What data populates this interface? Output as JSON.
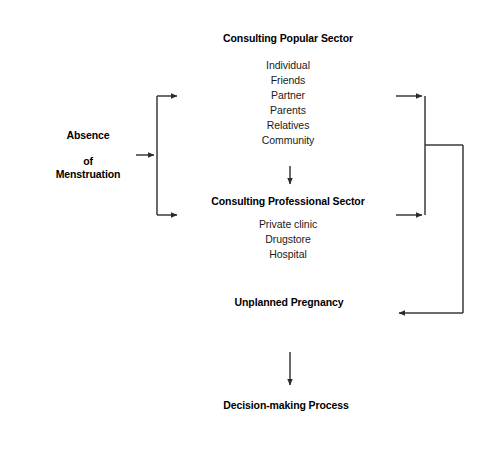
{
  "diagram": {
    "line_color": "#3a3a3a",
    "text_color": "#000000",
    "background": "#ffffff"
  },
  "nodes": {
    "absence": {
      "title_line1": "Absence",
      "title_line2": "of",
      "title_line3": "Menstruation"
    },
    "popular": {
      "title": "Consulting Popular Sector",
      "items": [
        "Individual",
        "Friends",
        "Partner",
        "Parents",
        "Relatives",
        "Community"
      ]
    },
    "professional": {
      "title": "Consulting Professional Sector",
      "items": [
        "Private clinic",
        "Drugstore",
        "Hospital"
      ]
    },
    "pregnancy": {
      "title": "Unplanned Pregnancy"
    },
    "decision": {
      "title": "Decision-making Process"
    }
  },
  "connectors": [
    {
      "name": "absence-to-branch",
      "from": "absence",
      "to": "branch-trunk"
    },
    {
      "name": "branch-to-popular",
      "from": "branch-trunk",
      "to": "popular"
    },
    {
      "name": "branch-to-professional",
      "from": "branch-trunk",
      "to": "professional"
    },
    {
      "name": "popular-to-professional",
      "from": "popular",
      "to": "professional"
    },
    {
      "name": "popular-to-return-trunk",
      "from": "popular",
      "to": "return-trunk"
    },
    {
      "name": "professional-to-return-trunk",
      "from": "professional",
      "to": "return-trunk"
    },
    {
      "name": "return-trunk-to-pregnancy",
      "from": "return-trunk",
      "to": "pregnancy"
    },
    {
      "name": "pregnancy-to-decision",
      "from": "pregnancy",
      "to": "decision"
    }
  ]
}
